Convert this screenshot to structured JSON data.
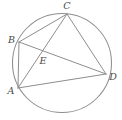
{
  "figure": {
    "type": "geometry-diagram",
    "background_color": "#ffffff",
    "stroke_color": "#8e8e8e",
    "label_color": "#4a4a4a",
    "circle": {
      "name": "circumscribed-circle",
      "center_x": 62,
      "center_y": 63,
      "radius": 49.5
    },
    "points": [
      {
        "id": "A",
        "label": "A",
        "x": 18,
        "y": 88,
        "label_x": 11,
        "label_y": 91,
        "on_circle": true
      },
      {
        "id": "B",
        "label": "B",
        "x": 19,
        "y": 42,
        "label_x": 11.5,
        "label_y": 40,
        "on_circle": true
      },
      {
        "id": "C",
        "label": "C",
        "x": 67,
        "y": 14,
        "label_x": 67,
        "label_y": 6,
        "on_circle": true
      },
      {
        "id": "D",
        "label": "D",
        "x": 106,
        "y": 74,
        "label_x": 113,
        "label_y": 77,
        "on_circle": true
      },
      {
        "id": "E",
        "label": "E",
        "x": 42,
        "y": 53,
        "label_x": 43,
        "label_y": 61,
        "on_circle": false
      }
    ],
    "segments": [
      {
        "id": "AB",
        "from": "A",
        "to": "B"
      },
      {
        "id": "BC",
        "from": "B",
        "to": "C"
      },
      {
        "id": "CD",
        "from": "C",
        "to": "D"
      },
      {
        "id": "AD",
        "from": "A",
        "to": "D"
      },
      {
        "id": "AC",
        "from": "A",
        "to": "C"
      },
      {
        "id": "BD",
        "from": "B",
        "to": "D"
      }
    ],
    "intersection": {
      "id": "E",
      "of": [
        "AC",
        "BD"
      ]
    }
  }
}
